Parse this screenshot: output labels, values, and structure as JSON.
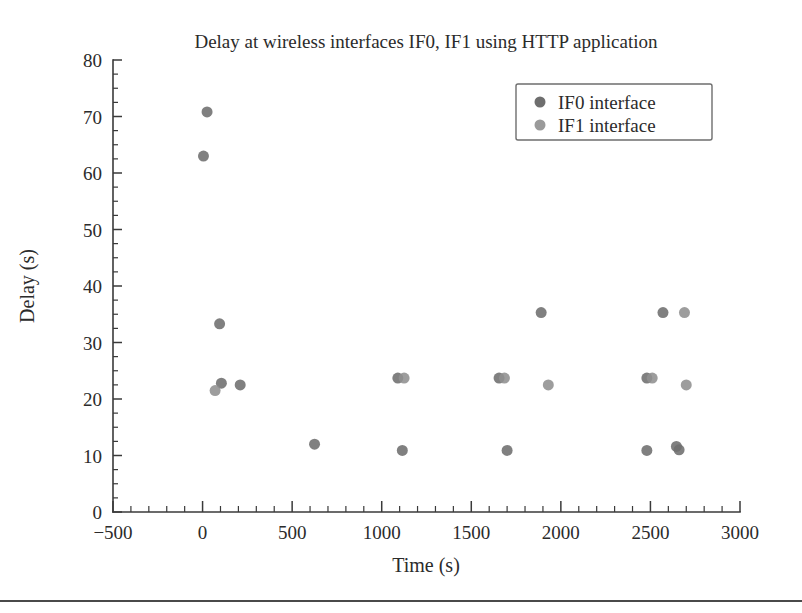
{
  "chart_data": {
    "type": "scatter",
    "title": "Delay at wireless interfaces IF0, IF1 using HTTP application",
    "xlabel": "Time (s)",
    "ylabel": "Delay (s)",
    "xlim": [
      -500,
      3000
    ],
    "ylim": [
      0,
      80
    ],
    "xticks": [
      -500,
      0,
      500,
      1000,
      1500,
      2000,
      2500,
      3000
    ],
    "xtick_labels": [
      "−500",
      "0",
      "500",
      "1000",
      "1500",
      "2000",
      "2500",
      "3000"
    ],
    "yticks": [
      0,
      10,
      20,
      30,
      40,
      50,
      60,
      70,
      80
    ],
    "ytick_labels": [
      "0",
      "10",
      "20",
      "30",
      "40",
      "50",
      "60",
      "70",
      "80"
    ],
    "x_minor_interval": 100,
    "y_minor_interval": 2.5,
    "grid": false,
    "legend_position": "upper right",
    "series": [
      {
        "name": "IF0 interface",
        "color": "#6e6e6e",
        "marker": "circle",
        "marker_size": 11,
        "points": [
          [
            25,
            70.8
          ],
          [
            5,
            63.0
          ],
          [
            95,
            33.3
          ],
          [
            105,
            22.8
          ],
          [
            210,
            22.5
          ],
          [
            625,
            12.0
          ],
          [
            1090,
            23.7
          ],
          [
            1115,
            10.9
          ],
          [
            1655,
            23.7
          ],
          [
            1700,
            10.9
          ],
          [
            1890,
            35.3
          ],
          [
            2480,
            23.7
          ],
          [
            2480,
            10.9
          ],
          [
            2570,
            35.3
          ],
          [
            2645,
            11.6
          ],
          [
            2660,
            11.0
          ]
        ]
      },
      {
        "name": "IF1 interface",
        "color": "#8f8f8f",
        "marker": "circle",
        "marker_size": 11,
        "points": [
          [
            70,
            21.5
          ],
          [
            1125,
            23.7
          ],
          [
            1685,
            23.7
          ],
          [
            1930,
            22.5
          ],
          [
            2510,
            23.7
          ],
          [
            2690,
            35.3
          ],
          [
            2700,
            22.5
          ]
        ]
      }
    ]
  },
  "axes": {
    "y_label": "Delay (s)",
    "x_label": "Time (s)"
  },
  "legend": {
    "entries": [
      {
        "label": "IF0 interface",
        "color": "#6e6e6e"
      },
      {
        "label": "IF1 interface",
        "color": "#9a9a9a"
      }
    ]
  },
  "colors": {
    "axis": "#3a3a3a",
    "text": "#2b2b2b",
    "if0": "#6e6e6e",
    "if1": "#9a9a9a",
    "background": "#ffffff",
    "rule": "#4a4a4a"
  }
}
